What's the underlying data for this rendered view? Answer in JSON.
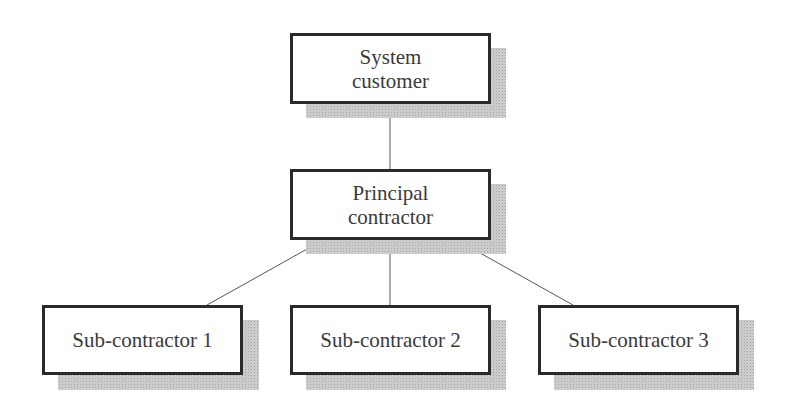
{
  "diagram": {
    "type": "hierarchy",
    "nodes": [
      {
        "id": "customer",
        "label": "System\ncustomer"
      },
      {
        "id": "principal",
        "label": "Principal\ncontractor"
      },
      {
        "id": "sub1",
        "label": "Sub-contractor 1"
      },
      {
        "id": "sub2",
        "label": "Sub-contractor 2"
      },
      {
        "id": "sub3",
        "label": "Sub-contractor 3"
      }
    ],
    "edges": [
      {
        "from": "customer",
        "to": "principal"
      },
      {
        "from": "principal",
        "to": "sub1"
      },
      {
        "from": "principal",
        "to": "sub2"
      },
      {
        "from": "principal",
        "to": "sub3"
      }
    ],
    "colors": {
      "border": "#2a2a2a",
      "text": "#3a3a3a",
      "line": "#555555",
      "shadow": "#c8c8c8"
    }
  }
}
